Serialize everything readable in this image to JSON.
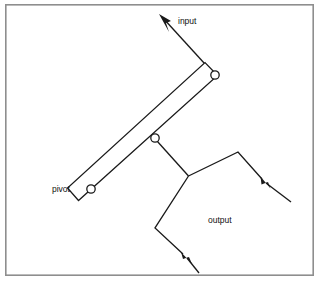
{
  "figure": {
    "type": "mechanical-linkage-diagram",
    "background_color": "#ffffff",
    "line_color": "#1a1a1a",
    "frame_color": "#8e8e8e"
  },
  "labels": {
    "input": "input",
    "pivot": "pivot",
    "output": "output"
  },
  "label_positions": {
    "input": {
      "x": 178,
      "y": 22
    },
    "pivot": {
      "x": 52,
      "y": 190
    },
    "output": {
      "x": 208,
      "y": 221
    }
  },
  "frame": {
    "x": 5,
    "y": 4,
    "width": 309,
    "height": 272
  },
  "bar": {
    "name": "lever-bar",
    "corners": "79,200 68,188 205,63 218,75",
    "pivot_end": {
      "x": 91,
      "y": 189
    },
    "input_end": {
      "x": 215,
      "y": 75
    }
  },
  "joints": [
    {
      "name": "pivot-joint",
      "x": 91,
      "y": 189,
      "r": 4.2
    },
    {
      "name": "input-joint",
      "x": 215,
      "y": 75,
      "r": 4.2
    },
    {
      "name": "mid-joint",
      "x": 155,
      "y": 138,
      "r": 4.2
    }
  ],
  "links": {
    "input_arrow_line": "215,75 162,17",
    "coupler_line": "157,141 188,176",
    "output_upper_line": "188,176 238,152 262,179",
    "output_lower_line": "188,176 155,228 183,254"
  },
  "arrows": [
    {
      "name": "input-force-arrow",
      "tip_x": 159,
      "tip_y": 14,
      "angle_deg": 228
    },
    {
      "name": "output-upper-arrow",
      "tip_x": 261,
      "tip_y": 177,
      "angle_deg": 318
    },
    {
      "name": "output-lower-arrow",
      "tip_x": 182,
      "tip_y": 253,
      "angle_deg": 312
    }
  ],
  "arrow_tails": {
    "output_upper": "266,182 291,202",
    "output_lower": "187,258 199,273"
  }
}
